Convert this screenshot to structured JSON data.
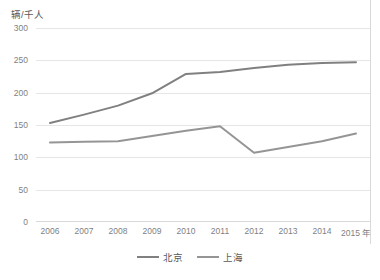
{
  "chart_data": {
    "type": "line",
    "title": "",
    "ylabel": "辆/千人",
    "xlabel": "年",
    "x": [
      "2006",
      "2007",
      "2008",
      "2009",
      "2010",
      "2011",
      "2012",
      "2013",
      "2014",
      "2015"
    ],
    "categories": [
      "2006",
      "2007",
      "2008",
      "2009",
      "2010",
      "2011",
      "2012",
      "2013",
      "2014",
      "2015"
    ],
    "ylim": [
      0,
      300
    ],
    "yticks": [
      0,
      50,
      100,
      150,
      200,
      250,
      300
    ],
    "ytick_labels": [
      "0",
      "50",
      "100",
      "150",
      "200",
      "250",
      "300"
    ],
    "grid": true,
    "legend_position": "bottom-center",
    "series": [
      {
        "name": "北京",
        "color": "#808080",
        "values": [
          153,
          166,
          180,
          199,
          229,
          232,
          238,
          243,
          246,
          247
        ]
      },
      {
        "name": "上海",
        "color": "#959595",
        "values": [
          123,
          124,
          125,
          133,
          141,
          148,
          107,
          116,
          125,
          137
        ]
      }
    ]
  },
  "axis": {
    "y_title": "辆/千人",
    "x_unit_suffix": "年"
  },
  "legend": {
    "items": [
      {
        "label": "北京",
        "color": "#808080"
      },
      {
        "label": "上海",
        "color": "#959595"
      }
    ]
  }
}
